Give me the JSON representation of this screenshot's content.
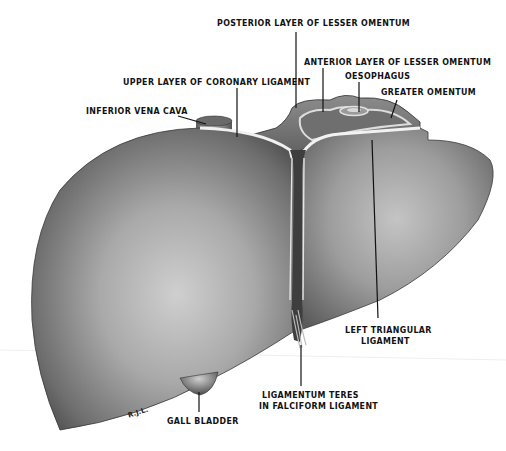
{
  "figure": {
    "signature": "R.J.L.",
    "colors": {
      "background": "#ffffff",
      "liver_light": "#d6d6d6",
      "liver_mid": "#9a9a9a",
      "liver_dark": "#4a4a4a",
      "peritoneum_edge": "#e8e8e8",
      "leader_line": "#111111"
    }
  },
  "labels": {
    "posterior_lesser_omentum": "POSTERIOR LAYER OF LESSER OMENTUM",
    "anterior_lesser_omentum": "ANTERIOR LAYER OF LESSER OMENTUM",
    "oesophagus": "OESOPHAGUS",
    "greater_omentum": "GREATER OMENTUM",
    "upper_coronary": "UPPER LAYER OF CORONARY LIGAMENT",
    "inferior_vena_cava": "INFERIOR VENA CAVA",
    "left_triangular_1": "LEFT TRIANGULAR",
    "left_triangular_2": "LIGAMENT",
    "ligamentum_teres_1": "LIGAMENTUM TERES",
    "ligamentum_teres_2": "IN FALCIFORM LIGAMENT",
    "gall_bladder": "GALL BLADDER"
  }
}
